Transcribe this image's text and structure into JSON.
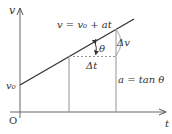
{
  "diagram": {
    "axes": {
      "y_label": "v",
      "x_label": "t",
      "origin_label": "O"
    },
    "line_equation": "v = v₀ + at",
    "intercept_label": "v₀",
    "angle_label": "θ",
    "delta_t_label": "Δt",
    "delta_v_label": "Δv",
    "slope_relation": "a = tan θ",
    "colors": {
      "line": "#333333",
      "axis": "#555555",
      "guide": "#888888",
      "background": "#ffffff"
    }
  }
}
